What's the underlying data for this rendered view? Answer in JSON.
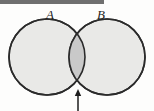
{
  "figure": {
    "type": "venn-diagram",
    "background_color": "#fdfdfc",
    "top_rule": {
      "name": "top-rule-bar",
      "color": "#6f6f6f",
      "x": 0,
      "y": 0,
      "width": 104,
      "height": 4
    },
    "sets": [
      {
        "id": "A",
        "label": "A",
        "label_x": 50,
        "label_y": 16,
        "center_x": 47,
        "center_y": 57,
        "radius": 38,
        "fill": "#e9e9e7",
        "stroke": "#2b2b2b"
      },
      {
        "id": "B",
        "label": "B",
        "label_x": 101,
        "label_y": 16,
        "center_x": 107,
        "center_y": 57,
        "radius": 38,
        "fill": "#e9e9e7",
        "stroke": "#2b2b2b"
      }
    ],
    "intersection": {
      "name": "intersection-region",
      "fill": "#c9c9c9",
      "stroke": "#2b2b2b",
      "top_vertex_x": 77,
      "top_vertex_y": 24,
      "bottom_vertex_x": 77,
      "bottom_vertex_y": 90
    },
    "arrow": {
      "name": "intersection-pointer-arrow",
      "color": "#1e1e1e",
      "tail_x": 78,
      "tail_y": 111,
      "tip_x": 78,
      "tip_y": 89,
      "direction": "up"
    }
  }
}
